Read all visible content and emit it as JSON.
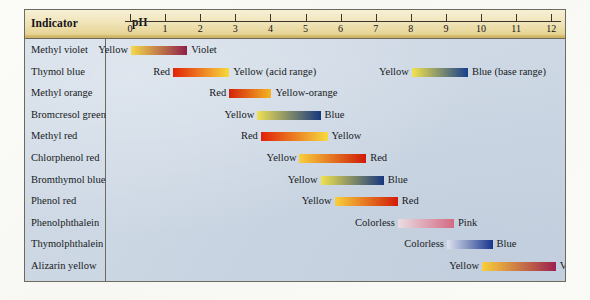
{
  "figure": {
    "header": {
      "indicator_column_label": "Indicator",
      "ph_axis_label": "pH"
    },
    "axis": {
      "ticks": [
        "0",
        "1",
        "2",
        "3",
        "4",
        "5",
        "6",
        "7",
        "8",
        "9",
        "10",
        "11",
        "12"
      ],
      "min": 0,
      "max": 12
    },
    "colors": {
      "header_band": "#efe3b5",
      "body_background": "#ccd7e4",
      "frame_border": "#6e6a60",
      "text": "#171a22"
    }
  },
  "chart_data": {
    "type": "bar",
    "xlabel": "pH",
    "ylabel": "Indicator",
    "xlim": [
      0,
      12
    ],
    "grid": false,
    "legend": "none",
    "categories": [
      "Methyl violet",
      "Thymol blue",
      "Methyl orange",
      "Bromcresol green",
      "Methyl red",
      "Chlorphenol red",
      "Bromthymol blue",
      "Phenol red",
      "Phenolphthalein",
      "Thymolphthalein",
      "Alizarin yellow"
    ],
    "bars": [
      {
        "indicator": "Methyl violet",
        "left_label": "Yellow",
        "right_label": "Violet",
        "ph_start": 0.0,
        "ph_end": 1.6,
        "color_start": "#f5d84a",
        "color_end": "#8e1f4a"
      },
      {
        "indicator": "Thymol blue",
        "left_label": "Red",
        "right_label": "Yellow (acid range)",
        "ph_start": 1.2,
        "ph_end": 2.8,
        "color_start": "#e32208",
        "color_end": "#f7d93c"
      },
      {
        "indicator": "Thymol blue",
        "left_label": "Yellow",
        "right_label": "Blue (base range)",
        "ph_start": 8.0,
        "ph_end": 9.6,
        "color_start": "#f2e34c",
        "color_end": "#163f8e"
      },
      {
        "indicator": "Methyl orange",
        "left_label": "Red",
        "right_label": "Yellow-orange",
        "ph_start": 2.8,
        "ph_end": 4.0,
        "color_start": "#d4220b",
        "color_end": "#f5b424"
      },
      {
        "indicator": "Bromcresol green",
        "left_label": "Yellow",
        "right_label": "Blue",
        "ph_start": 3.6,
        "ph_end": 5.4,
        "color_start": "#efe054",
        "color_end": "#15387f"
      },
      {
        "indicator": "Methyl red",
        "left_label": "Red",
        "right_label": "Yellow",
        "ph_start": 3.7,
        "ph_end": 5.6,
        "color_start": "#e02208",
        "color_end": "#f6da3e"
      },
      {
        "indicator": "Chlorphenol red",
        "left_label": "Yellow",
        "right_label": "Red",
        "ph_start": 4.8,
        "ph_end": 6.7,
        "color_start": "#f8cf3c",
        "color_end": "#cf1a08"
      },
      {
        "indicator": "Bromthymol blue",
        "left_label": "Yellow",
        "right_label": "Blue",
        "ph_start": 5.4,
        "ph_end": 7.2,
        "color_start": "#f0e24e",
        "color_end": "#16377f"
      },
      {
        "indicator": "Phenol red",
        "left_label": "Yellow",
        "right_label": "Red",
        "ph_start": 5.8,
        "ph_end": 7.6,
        "color_start": "#f8cf3c",
        "color_end": "#d21b08"
      },
      {
        "indicator": "Phenolphthalein",
        "left_label": "Colorless",
        "right_label": "Pink",
        "ph_start": 7.6,
        "ph_end": 9.2,
        "color_start": "#e9dde2",
        "color_end": "#d46a84"
      },
      {
        "indicator": "Thymolphthalein",
        "left_label": "Colorless",
        "right_label": "Blue",
        "ph_start": 9.0,
        "ph_end": 10.3,
        "color_start": "#dfe3ee",
        "color_end": "#17348c"
      },
      {
        "indicator": "Alizarin yellow",
        "left_label": "Yellow",
        "right_label": "Violet",
        "ph_start": 10.0,
        "ph_end": 12.1,
        "color_start": "#f9cf3a",
        "color_end": "#9d2150"
      }
    ]
  },
  "rows": [
    {
      "name": "Methyl violet"
    },
    {
      "name": "Thymol blue"
    },
    {
      "name": "Methyl orange"
    },
    {
      "name": "Bromcresol green"
    },
    {
      "name": "Methyl red"
    },
    {
      "name": "Chlorphenol red"
    },
    {
      "name": "Bromthymol blue"
    },
    {
      "name": "Phenol red"
    },
    {
      "name": "Phenolphthalein"
    },
    {
      "name": "Thymolphthalein"
    },
    {
      "name": "Alizarin yellow"
    }
  ]
}
